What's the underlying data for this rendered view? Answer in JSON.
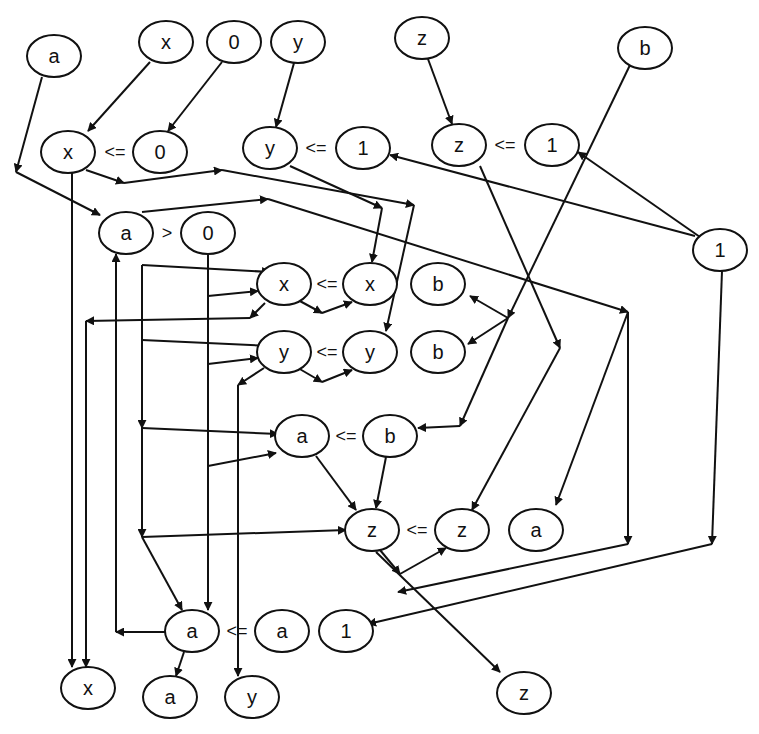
{
  "diagram": {
    "type": "dataflow-graph",
    "colors": {
      "stroke": "#111111",
      "background": "#ffffff"
    },
    "nodes": [
      {
        "id": "in_a",
        "label": "a"
      },
      {
        "id": "in_x",
        "label": "x"
      },
      {
        "id": "in_0",
        "label": "0"
      },
      {
        "id": "in_y",
        "label": "y"
      },
      {
        "id": "in_z",
        "label": "z"
      },
      {
        "id": "in_b",
        "label": "b"
      },
      {
        "id": "c1_x",
        "label": "x"
      },
      {
        "id": "c1_0",
        "label": "0"
      },
      {
        "id": "c2_y",
        "label": "y"
      },
      {
        "id": "c2_1",
        "label": "1"
      },
      {
        "id": "c3_z",
        "label": "z"
      },
      {
        "id": "c3_1",
        "label": "1"
      },
      {
        "id": "k_1",
        "label": "1"
      },
      {
        "id": "g_a",
        "label": "a"
      },
      {
        "id": "g_0",
        "label": "0"
      },
      {
        "id": "a1_x",
        "label": "x"
      },
      {
        "id": "a1_xr",
        "label": "x"
      },
      {
        "id": "b_top",
        "label": "b"
      },
      {
        "id": "a2_y",
        "label": "y"
      },
      {
        "id": "a2_yr",
        "label": "y"
      },
      {
        "id": "b_mid",
        "label": "b"
      },
      {
        "id": "a3_a",
        "label": "a"
      },
      {
        "id": "a3_b",
        "label": "b"
      },
      {
        "id": "a4_z",
        "label": "z"
      },
      {
        "id": "a4_zr",
        "label": "z"
      },
      {
        "id": "out_a_mid",
        "label": "a"
      },
      {
        "id": "a5_a",
        "label": "a"
      },
      {
        "id": "a5_ar",
        "label": "a"
      },
      {
        "id": "out_1",
        "label": "1"
      },
      {
        "id": "out_x",
        "label": "x"
      },
      {
        "id": "out_a",
        "label": "a"
      },
      {
        "id": "out_y",
        "label": "y"
      },
      {
        "id": "out_z",
        "label": "z"
      }
    ],
    "operators": [
      {
        "id": "op1",
        "label": "<="
      },
      {
        "id": "op2",
        "label": "<="
      },
      {
        "id": "op3",
        "label": "<="
      },
      {
        "id": "op4",
        "label": ">"
      },
      {
        "id": "op5",
        "label": "<="
      },
      {
        "id": "op6",
        "label": "<="
      },
      {
        "id": "op7",
        "label": "<="
      },
      {
        "id": "op8",
        "label": "<="
      },
      {
        "id": "op9",
        "label": "<="
      }
    ]
  }
}
